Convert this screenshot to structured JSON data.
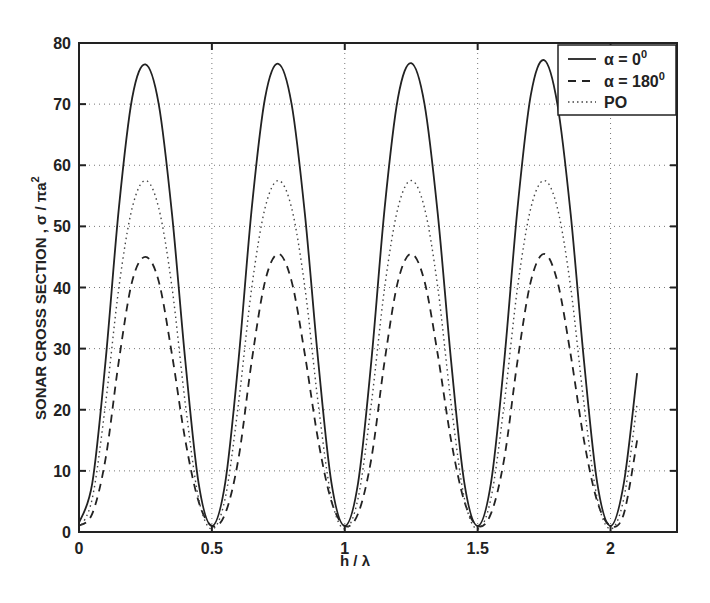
{
  "chart_data": {
    "type": "line",
    "title": "",
    "xlabel": "h / λ",
    "ylabel": "SONAR CROSS SECTION , σ / πa²",
    "xlim": [
      0,
      2.25
    ],
    "ylim": [
      0,
      80
    ],
    "xticks": [
      0,
      0.5,
      1,
      1.5,
      2
    ],
    "xtick_labels": [
      "0",
      "0.5",
      "1",
      "1.5",
      "2"
    ],
    "yticks": [
      0,
      10,
      20,
      30,
      40,
      50,
      60,
      70,
      80
    ],
    "ytick_labels": [
      "0",
      "10",
      "20",
      "30",
      "40",
      "50",
      "60",
      "70",
      "80"
    ],
    "grid": true,
    "legend_position": "upper right",
    "series": [
      {
        "name": "α = 0⁰",
        "style": "solid",
        "x": [
          0,
          0.05,
          0.1,
          0.15,
          0.2,
          0.25,
          0.3,
          0.35,
          0.4,
          0.45,
          0.5,
          0.55,
          0.6,
          0.65,
          0.7,
          0.75,
          0.8,
          0.85,
          0.9,
          0.95,
          1.0,
          1.05,
          1.1,
          1.15,
          1.2,
          1.25,
          1.3,
          1.35,
          1.4,
          1.45,
          1.5,
          1.55,
          1.6,
          1.65,
          1.7,
          1.75,
          1.8,
          1.85,
          1.9,
          1.95,
          2.0,
          2.05,
          2.1
        ],
        "values": [
          1.5,
          8,
          28,
          53,
          71,
          76.5,
          70,
          52,
          28,
          8,
          1,
          8,
          28,
          53,
          71,
          76.6,
          70,
          52,
          28,
          8,
          1,
          8,
          28,
          53,
          71,
          76.7,
          70,
          52,
          28,
          8,
          1,
          8,
          28,
          53,
          71.5,
          77.2,
          70,
          52,
          28,
          8,
          1,
          8,
          26
        ]
      },
      {
        "name": "α = 180⁰",
        "style": "dashed",
        "x": [
          0,
          0.05,
          0.1,
          0.15,
          0.2,
          0.25,
          0.3,
          0.35,
          0.4,
          0.45,
          0.5,
          0.55,
          0.6,
          0.65,
          0.7,
          0.75,
          0.8,
          0.85,
          0.9,
          0.95,
          1.0,
          1.05,
          1.1,
          1.15,
          1.2,
          1.25,
          1.3,
          1.35,
          1.4,
          1.45,
          1.5,
          1.55,
          1.6,
          1.65,
          1.7,
          1.75,
          1.8,
          1.85,
          1.9,
          1.95,
          2.0,
          2.05,
          2.1
        ],
        "values": [
          1,
          3,
          12,
          28,
          41,
          45,
          41,
          29,
          15,
          5,
          1,
          3,
          12,
          28,
          41,
          45.5,
          41,
          29,
          15,
          5,
          1,
          3,
          12,
          28,
          41,
          45.5,
          41,
          29,
          15,
          5,
          1,
          3,
          12,
          28,
          41,
          45.5,
          41,
          29,
          15,
          5,
          1,
          3,
          15
        ]
      },
      {
        "name": "PO",
        "style": "dotted",
        "x": [
          0,
          0.05,
          0.1,
          0.15,
          0.2,
          0.25,
          0.3,
          0.35,
          0.4,
          0.45,
          0.5,
          0.55,
          0.6,
          0.65,
          0.7,
          0.75,
          0.8,
          0.85,
          0.9,
          0.95,
          1.0,
          1.05,
          1.1,
          1.15,
          1.2,
          1.25,
          1.3,
          1.35,
          1.4,
          1.45,
          1.5,
          1.55,
          1.6,
          1.65,
          1.7,
          1.75,
          1.8,
          1.85,
          1.9,
          1.95,
          2.0,
          2.05,
          2.1
        ],
        "values": [
          0.5,
          5.5,
          21,
          40,
          53,
          57.5,
          53,
          40,
          21,
          5.5,
          0.5,
          5.5,
          21,
          40,
          53,
          57.5,
          53,
          40,
          21,
          5.5,
          0.5,
          5.5,
          21,
          40,
          53,
          57.5,
          53,
          40,
          21,
          5.5,
          0.5,
          5.5,
          21,
          40,
          53,
          57.5,
          53,
          40,
          21,
          5.5,
          0.5,
          5.5,
          21
        ]
      }
    ]
  },
  "legend": {
    "items": [
      {
        "label_base": "α = 0",
        "label_sup": "0"
      },
      {
        "label_base": "α = 180",
        "label_sup": "0"
      },
      {
        "label_base": "PO",
        "label_sup": ""
      }
    ]
  },
  "axes": {
    "xlabel": "h / λ",
    "ylabel_main": "SONAR  CROSS  SECTION , σ / πa",
    "ylabel_sup": "2"
  }
}
